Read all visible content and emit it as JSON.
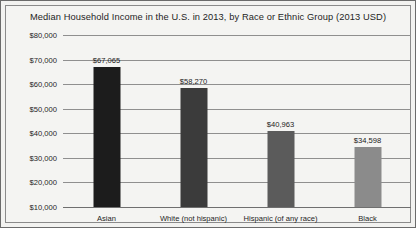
{
  "chart_data": {
    "type": "bar",
    "title": "Median Household Income in the U.S. in 2013, by Race or Ethnic Group (2013 USD)",
    "xlabel": "",
    "ylabel": "",
    "categories": [
      "Asian",
      "White (not hispanic)",
      "Hispanic (of any race)",
      "Black"
    ],
    "values": [
      67065,
      58270,
      40963,
      34598
    ],
    "value_labels": [
      "$67,065",
      "$58,270",
      "$40,963",
      "$34,598"
    ],
    "bar_colors": [
      "#1c1c1c",
      "#3b3b3b",
      "#5b5b5b",
      "#8b8b8b"
    ],
    "ylim": [
      10000,
      80000
    ],
    "ytick_labels": [
      "$80,000",
      "$70,000",
      "$60,000",
      "$50,000",
      "$40,000",
      "$30,000",
      "$20,000",
      "$10,000"
    ],
    "ytick_values": [
      80000,
      70000,
      60000,
      50000,
      40000,
      30000,
      20000,
      10000
    ],
    "grid": true,
    "legend": "none",
    "background_color": "#f2f2f0",
    "grid_color": "#8f8f8f",
    "text_color": "#1e1e1e"
  }
}
